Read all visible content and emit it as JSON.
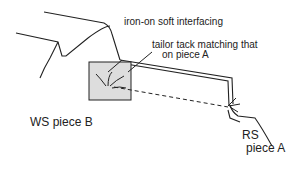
{
  "diagram": {
    "labels": {
      "interfacing": "iron-on soft interfacing",
      "tack_line1": "tailor tack matching that",
      "tack_line2": "on piece A",
      "ws_piece_b": "WS piece B",
      "rs_line1": "RS",
      "rs_line2": "piece A"
    }
  }
}
